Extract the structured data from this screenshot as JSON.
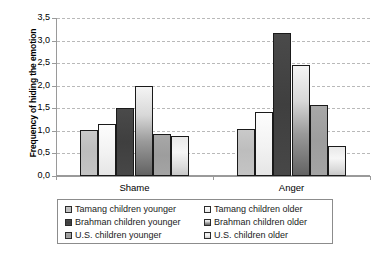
{
  "chart_data": {
    "type": "bar",
    "title": "",
    "xlabel": "",
    "ylabel": "Frequency of hiding the emotion",
    "categories": [
      "Shame",
      "Anger"
    ],
    "ylim": [
      0.0,
      3.5
    ],
    "yticks": [
      "0,0",
      "0,5",
      "1,0",
      "1,5",
      "2,0",
      "2,5",
      "3,0",
      "3,5"
    ],
    "ytick_values": [
      0.0,
      0.5,
      1.0,
      1.5,
      2.0,
      2.5,
      3.0,
      3.5
    ],
    "grid": "horizontal-dashed",
    "legend_position": "below-plot",
    "decimal_separator": "comma",
    "series": [
      {
        "name": "Tamang children younger",
        "values": [
          1.02,
          1.05
        ],
        "swatch": "#c2c2c2"
      },
      {
        "name": "Tamang children older",
        "values": [
          1.15,
          1.42
        ],
        "swatch": "#f4f4f4"
      },
      {
        "name": "Brahman children younger",
        "values": [
          1.5,
          3.17
        ],
        "swatch": "#434343"
      },
      {
        "name": "Brahman children older",
        "values": [
          2.0,
          2.45
        ],
        "swatch": "#b0b0b0"
      },
      {
        "name": "U.S. children younger",
        "values": [
          0.93,
          1.57
        ],
        "swatch": "#9d9d9d"
      },
      {
        "name": "U.S. children older",
        "values": [
          0.88,
          0.67
        ],
        "swatch": "#e4e4e4"
      }
    ]
  },
  "axis": {
    "y_title": "Frequency of hiding the emotion"
  },
  "legend": {
    "left_column": [
      "Tamang children younger",
      "Brahman children younger",
      "U.S. children younger"
    ],
    "right_column": [
      "Tamang children older",
      "Brahman children older",
      "U.S. children older"
    ]
  },
  "caption": {
    "text": ""
  }
}
